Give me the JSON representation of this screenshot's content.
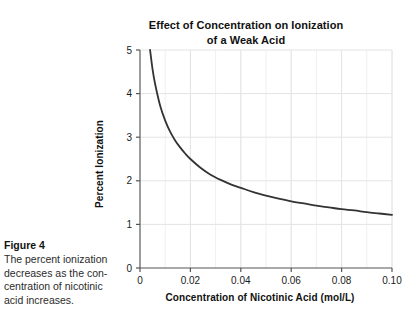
{
  "figure": {
    "caption_title": "Figure 4",
    "caption_text": "The percent ionization decreases as the con-centration of nicotinic acid increases.",
    "caption_lines": [
      "The percent ionization",
      "decreases as the con-",
      "centration of nicotinic",
      "acid increases."
    ]
  },
  "chart_data": {
    "type": "line",
    "title_lines": [
      "Effect of Concentration on Ionization",
      "of a Weak Acid"
    ],
    "xlabel": "Concentration of Nicotinic Acid (mol/L)",
    "ylabel": "Percent Ionization",
    "xlim": [
      0,
      0.1
    ],
    "ylim": [
      0,
      5
    ],
    "xticks": [
      0,
      0.02,
      0.04,
      0.06,
      0.08,
      0.1
    ],
    "xticklabels": [
      "0",
      "0.02",
      "0.04",
      "0.06",
      "0.08",
      "0.10"
    ],
    "yticks": [
      0,
      1,
      2,
      3,
      4,
      5
    ],
    "yticklabels": [
      "0",
      "1",
      "2",
      "3",
      "4",
      "5"
    ],
    "grid": "major and minor gridlines, light gray",
    "grid_major_x_step": 0.02,
    "grid_minor_x_step": 0.01,
    "grid_major_y_step": 1,
    "legend": "none",
    "line_color": "#333333",
    "line_width": 1.8,
    "series": [
      {
        "name": "Percent ionization of nicotinic acid",
        "x": [
          0.004,
          0.005,
          0.006,
          0.008,
          0.01,
          0.012,
          0.014,
          0.016,
          0.018,
          0.02,
          0.024,
          0.028,
          0.032,
          0.036,
          0.04,
          0.045,
          0.05,
          0.055,
          0.06,
          0.065,
          0.07,
          0.075,
          0.08,
          0.085,
          0.09,
          0.095,
          0.1
        ],
        "y": [
          5.0,
          4.55,
          4.22,
          3.72,
          3.38,
          3.12,
          2.92,
          2.76,
          2.62,
          2.5,
          2.3,
          2.14,
          2.02,
          1.92,
          1.84,
          1.74,
          1.66,
          1.59,
          1.53,
          1.48,
          1.43,
          1.39,
          1.35,
          1.32,
          1.28,
          1.25,
          1.22
        ]
      }
    ]
  },
  "axes": {
    "spine_color": "#888888",
    "grid_color": "#e4e4e4"
  }
}
